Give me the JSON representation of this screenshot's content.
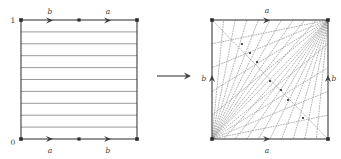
{
  "figure": {
    "type": "mathematical-diagram",
    "colors": {
      "border": "#3d3d3d",
      "leaf_line": "#8d8d8d",
      "dotted_line": "#9a9a9a",
      "text": "#3a3a3a",
      "background": "#ffffff",
      "vertex": "#2b2b2b"
    },
    "left_panel": {
      "name": "foliated-square",
      "square": {
        "x": 21,
        "y": 20,
        "width": 116,
        "height": 119
      },
      "corner_labels": [
        {
          "text": "1",
          "x": 13,
          "y": 23,
          "italic": false
        },
        {
          "text": "0",
          "x": 13,
          "y": 145,
          "italic": false
        }
      ],
      "edge_labels": [
        {
          "text": "b",
          "x": 50,
          "y": 14,
          "edge": "top-left-half"
        },
        {
          "text": "a",
          "x": 108,
          "y": 14,
          "edge": "top-right-half"
        },
        {
          "text": "a",
          "x": 50,
          "y": 154,
          "edge": "bottom-left-half"
        },
        {
          "text": "b",
          "x": 108,
          "y": 154,
          "edge": "bottom-right-half"
        }
      ],
      "horizontal_leaf_count": 9,
      "edge_arrow_fractions": [
        0.25,
        0.75
      ],
      "edge_midpoint_dot": true
    },
    "middle_arrow": {
      "name": "maps-to-arrow",
      "x1": 157,
      "y1": 76,
      "x2": 191,
      "y2": 76
    },
    "right_panel": {
      "name": "laminated-square",
      "square": {
        "x": 212,
        "y": 20,
        "width": 116,
        "height": 119
      },
      "edge_labels": [
        {
          "text": "a",
          "x": 267,
          "y": 13,
          "edge": "top"
        },
        {
          "text": "a",
          "x": 267,
          "y": 154,
          "edge": "bottom"
        },
        {
          "text": "b",
          "x": 203,
          "y": 79,
          "edge": "left"
        },
        {
          "text": "b",
          "x": 333,
          "y": 79,
          "edge": "right"
        }
      ],
      "fan_origins": [
        "bottom-left",
        "top-right"
      ],
      "fan_ray_count": 9,
      "dotted": true
    }
  }
}
